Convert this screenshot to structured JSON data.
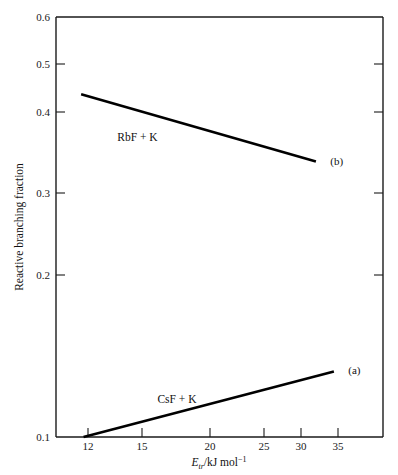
{
  "chart_data": {
    "type": "line",
    "title": "",
    "xlabel": "Etr/kJ mol-1",
    "xlabel_parts": {
      "symbol": "E",
      "subscript": "tr",
      "units": "/kJ mol",
      "superscript": "−1"
    },
    "ylabel": "Reactive branching fraction",
    "xlim": [
      10.7,
      38.0
    ],
    "ylim": [
      0.1,
      0.6
    ],
    "xticks": [
      12,
      15,
      20,
      25,
      30,
      35
    ],
    "xtick_labels": [
      "12",
      "15",
      "20",
      "25",
      "30",
      "35"
    ],
    "yticks": [
      0.1,
      0.2,
      0.3,
      0.4,
      0.5,
      0.6
    ],
    "ytick_labels": [
      "0.1",
      "0.2",
      "0.3",
      "0.4",
      "0.5",
      "0.6"
    ],
    "grid": false,
    "legend": "inline-annotations",
    "series": [
      {
        "name": "CsF + K",
        "tag": "(a)",
        "inline_label": "CsF + K",
        "x": [
          13.0,
          33.9
        ],
        "values": [
          0.1,
          0.178
        ]
      },
      {
        "name": "RbF + K",
        "tag": "(b)",
        "inline_label": "RbF + K",
        "x": [
          12.8,
          32.4
        ],
        "values": [
          0.508,
          0.428
        ]
      }
    ],
    "annotations": [
      {
        "text": "RbF + K",
        "x": 17.5,
        "y": 0.452
      },
      {
        "text": "CsF + K",
        "x": 20.8,
        "y": 0.14
      },
      {
        "text": "(b)",
        "x": 33.6,
        "y": 0.424
      },
      {
        "text": "(a)",
        "x": 35.1,
        "y": 0.175
      }
    ],
    "colors": {
      "line": "#000000",
      "axis": "#1a1a1a",
      "background": "#ffffff"
    }
  },
  "axes": {
    "y_tick_0": "0.6",
    "y_tick_1": "0.5",
    "y_tick_2": "0.4",
    "y_tick_3": "0.3",
    "y_tick_4": "0.2",
    "y_tick_5": "0.1",
    "x_tick_0": "12",
    "x_tick_1": "15",
    "x_tick_2": "20",
    "x_tick_3": "25",
    "x_tick_4": "30",
    "x_tick_5": "35",
    "y_title": "Reactive branching fraction",
    "x_symbol": "E",
    "x_sub": "tr",
    "x_units": "/kJ mol",
    "x_sup": "−1"
  },
  "labels": {
    "upper_series": "RbF + K",
    "lower_series": "CsF + K",
    "tag_b": "(b)",
    "tag_a": "(a)"
  }
}
